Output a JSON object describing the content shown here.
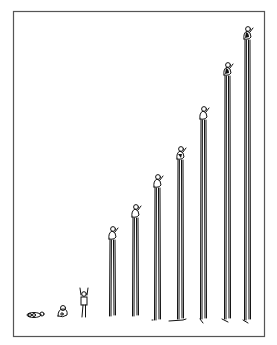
{
  "illustration": {
    "description": "Cartoon sequence: a baby crawling, sitting, standing, then a figure standing atop progressively taller pairs of stilts/poles",
    "frame": {
      "x": 13,
      "y": 11,
      "width": 252,
      "height": 326,
      "stroke": "#555555"
    },
    "ink_color": "#111111",
    "background": "#ffffff",
    "figures": [
      {
        "stage": 1,
        "pose": "crawling",
        "x": 34,
        "ground": 318,
        "pole_top": null
      },
      {
        "stage": 2,
        "pose": "sitting",
        "x": 62,
        "ground": 318,
        "pole_top": null
      },
      {
        "stage": 3,
        "pose": "standing-arms-up",
        "x": 84,
        "ground": 318,
        "pole_top": null
      },
      {
        "stage": 4,
        "pose": "on-stilts",
        "x": 112,
        "ground": 316,
        "pole_top": 240
      },
      {
        "stage": 5,
        "pose": "on-stilts",
        "x": 135,
        "ground": 316,
        "pole_top": 218
      },
      {
        "stage": 6,
        "pose": "on-stilts",
        "x": 157,
        "ground": 320,
        "pole_top": 188
      },
      {
        "stage": 7,
        "pose": "on-stilts",
        "x": 180,
        "ground": 319,
        "pole_top": 160
      },
      {
        "stage": 8,
        "pose": "on-stilts",
        "x": 203,
        "ground": 319,
        "pole_top": 120
      },
      {
        "stage": 9,
        "pose": "on-stilts",
        "x": 227,
        "ground": 319,
        "pole_top": 76
      },
      {
        "stage": 10,
        "pose": "on-stilts",
        "x": 247,
        "ground": 320,
        "pole_top": 40
      }
    ]
  }
}
